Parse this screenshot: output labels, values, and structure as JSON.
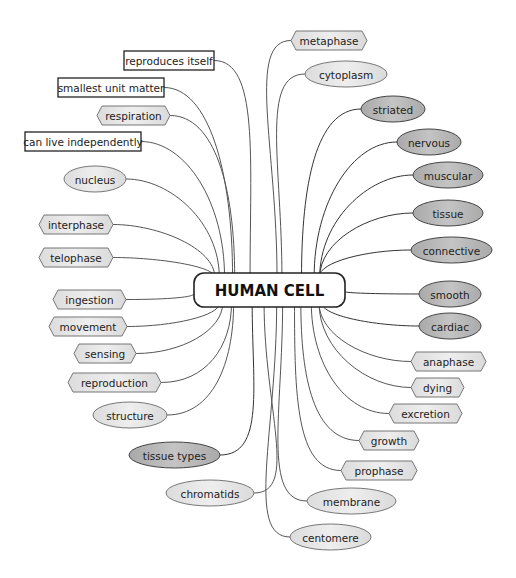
{
  "diagram": {
    "type": "mind-map",
    "center": {
      "label": "HUMAN CELL",
      "x": 194,
      "y": 273,
      "w": 151,
      "h": 34
    },
    "colors": {
      "box_fill": "#ffffff",
      "box_stroke": "#222222",
      "light_fill": "#e9e9e9",
      "dark_fill": "#b9b9b9",
      "stroke": "#666666",
      "line": "#555555"
    },
    "nodes": [
      {
        "id": "reproduces-itself",
        "label": "reproduces itself",
        "shape": "rect",
        "x": 124,
        "y": 51,
        "w": 90,
        "h": 19,
        "side": "left"
      },
      {
        "id": "smallest-unit-matter",
        "label": "smallest unit matter",
        "shape": "rect",
        "x": 58,
        "y": 78,
        "w": 106,
        "h": 19,
        "side": "left"
      },
      {
        "id": "respiration",
        "label": "respiration",
        "shape": "hex",
        "x": 97,
        "y": 106,
        "w": 73,
        "h": 19,
        "tone": "light",
        "side": "left"
      },
      {
        "id": "can-live-independently",
        "label": "can live independently",
        "shape": "rect",
        "x": 25,
        "y": 132,
        "w": 116,
        "h": 19,
        "side": "left"
      },
      {
        "id": "nucleus",
        "label": "nucleus",
        "shape": "ellipse",
        "x": 64,
        "y": 166,
        "w": 62,
        "h": 26,
        "tone": "light",
        "side": "left"
      },
      {
        "id": "interphase",
        "label": "interphase",
        "shape": "hex",
        "x": 39,
        "y": 215,
        "w": 74,
        "h": 19,
        "tone": "light",
        "side": "left"
      },
      {
        "id": "telophase",
        "label": "telophase",
        "shape": "hex",
        "x": 39,
        "y": 248,
        "w": 74,
        "h": 19,
        "tone": "light",
        "side": "left"
      },
      {
        "id": "ingestion",
        "label": "ingestion",
        "shape": "hex",
        "x": 53,
        "y": 290,
        "w": 73,
        "h": 19,
        "tone": "light",
        "side": "left"
      },
      {
        "id": "movement",
        "label": "movement",
        "shape": "hex",
        "x": 49,
        "y": 317,
        "w": 78,
        "h": 19,
        "tone": "light",
        "side": "left"
      },
      {
        "id": "sensing",
        "label": "sensing",
        "shape": "hex",
        "x": 74,
        "y": 344,
        "w": 62,
        "h": 19,
        "tone": "light",
        "side": "left"
      },
      {
        "id": "reproduction",
        "label": "reproduction",
        "shape": "hex",
        "x": 68,
        "y": 373,
        "w": 93,
        "h": 19,
        "tone": "light",
        "side": "left"
      },
      {
        "id": "structure",
        "label": "structure",
        "shape": "ellipse",
        "x": 93,
        "y": 402,
        "w": 74,
        "h": 26,
        "tone": "light",
        "side": "left"
      },
      {
        "id": "tissue-types",
        "label": "tissue types",
        "shape": "ellipse",
        "x": 129,
        "y": 442,
        "w": 91,
        "h": 26,
        "tone": "dark",
        "side": "left"
      },
      {
        "id": "chromatids",
        "label": "chromatids",
        "shape": "ellipse",
        "x": 166,
        "y": 480,
        "w": 88,
        "h": 26,
        "tone": "light",
        "side": "left"
      },
      {
        "id": "metaphase",
        "label": "metaphase",
        "shape": "hex",
        "x": 291,
        "y": 31,
        "w": 76,
        "h": 19,
        "tone": "light",
        "side": "right"
      },
      {
        "id": "cytoplasm",
        "label": "cytoplasm",
        "shape": "ellipse",
        "x": 305,
        "y": 61,
        "w": 82,
        "h": 26,
        "tone": "light",
        "side": "right"
      },
      {
        "id": "striated",
        "label": "striated",
        "shape": "ellipse",
        "x": 361,
        "y": 96,
        "w": 64,
        "h": 26,
        "tone": "dark",
        "side": "right"
      },
      {
        "id": "nervous",
        "label": "nervous",
        "shape": "ellipse",
        "x": 397,
        "y": 129,
        "w": 64,
        "h": 26,
        "tone": "dark",
        "side": "right"
      },
      {
        "id": "muscular",
        "label": "muscular",
        "shape": "ellipse",
        "x": 413,
        "y": 162,
        "w": 70,
        "h": 26,
        "tone": "dark",
        "side": "right"
      },
      {
        "id": "tissue",
        "label": "tissue",
        "shape": "ellipse",
        "x": 413,
        "y": 200,
        "w": 70,
        "h": 26,
        "tone": "dark",
        "side": "right"
      },
      {
        "id": "connective",
        "label": "connective",
        "shape": "ellipse",
        "x": 411,
        "y": 237,
        "w": 81,
        "h": 26,
        "tone": "dark",
        "side": "right"
      },
      {
        "id": "smooth",
        "label": "smooth",
        "shape": "ellipse",
        "x": 419,
        "y": 281,
        "w": 62,
        "h": 26,
        "tone": "dark",
        "side": "right"
      },
      {
        "id": "cardiac",
        "label": "cardiac",
        "shape": "ellipse",
        "x": 419,
        "y": 313,
        "w": 62,
        "h": 26,
        "tone": "dark",
        "side": "right"
      },
      {
        "id": "anaphase",
        "label": "anaphase",
        "shape": "hex",
        "x": 411,
        "y": 352,
        "w": 75,
        "h": 19,
        "tone": "light",
        "side": "right"
      },
      {
        "id": "dying",
        "label": "dying",
        "shape": "hex",
        "x": 411,
        "y": 378,
        "w": 53,
        "h": 19,
        "tone": "light",
        "side": "right"
      },
      {
        "id": "excretion",
        "label": "excretion",
        "shape": "hex",
        "x": 389,
        "y": 404,
        "w": 73,
        "h": 19,
        "tone": "light",
        "side": "right"
      },
      {
        "id": "growth",
        "label": "growth",
        "shape": "hex",
        "x": 359,
        "y": 431,
        "w": 60,
        "h": 19,
        "tone": "light",
        "side": "right"
      },
      {
        "id": "prophase",
        "label": "prophase",
        "shape": "hex",
        "x": 341,
        "y": 461,
        "w": 76,
        "h": 19,
        "tone": "light",
        "side": "right"
      },
      {
        "id": "membrane",
        "label": "membrane",
        "shape": "ellipse",
        "x": 307,
        "y": 488,
        "w": 89,
        "h": 26,
        "tone": "light",
        "side": "right"
      },
      {
        "id": "centomere",
        "label": "centomere",
        "shape": "ellipse",
        "x": 290,
        "y": 524,
        "w": 81,
        "h": 26,
        "tone": "light",
        "side": "right"
      }
    ]
  }
}
